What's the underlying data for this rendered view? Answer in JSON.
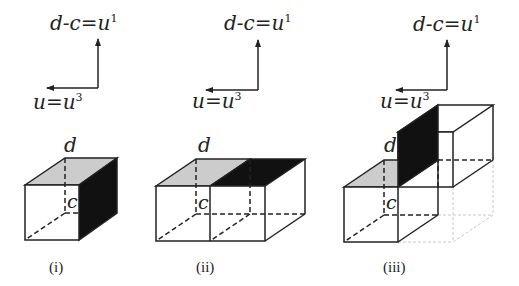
{
  "colors": {
    "line": "#222222",
    "gray_face": "#cccccc",
    "black_face": "#111111",
    "faint": "#c8c8c8"
  },
  "panels": [
    {
      "caption": "(i)",
      "axis_up_label": "d-c=u",
      "axis_up_sup": "1",
      "axis_left_label": "u=u",
      "axis_left_sup": "3",
      "label_d": "d",
      "label_c": "c"
    },
    {
      "caption": "(ii)",
      "axis_up_label": "d-c=u",
      "axis_up_sup": "1",
      "axis_left_label": "u=u",
      "axis_left_sup": "3",
      "label_d": "d",
      "label_c": "c"
    },
    {
      "caption": "(iii)",
      "axis_up_label": "d-c=u",
      "axis_up_sup": "1",
      "axis_left_label": "u=u",
      "axis_left_sup": "3",
      "label_d": "d",
      "label_c": "c"
    }
  ]
}
